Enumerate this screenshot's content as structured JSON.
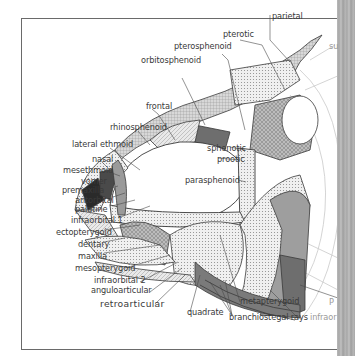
{
  "figure": {
    "labels": {
      "parietal": "parietal",
      "pterotic": "pterotic",
      "pterosphenoid": "pterosphenoid",
      "orbitosphenoid": "orbitosphenoid",
      "frontal": "frontal",
      "rhinosphenoid": "rhinosphenoid",
      "lateral_ethmoid": "lateral ethmoid",
      "nasal": "nasal",
      "mesethmoid": "mesethmoid",
      "vomer": "vomer",
      "premaxilla": "premaxilla",
      "antorbital": "antorbital",
      "palatine": "palatine",
      "infraorbital_1": "infraorbital 1",
      "ectopterygoid": "ectopterygoid",
      "dentary": "dentary",
      "maxilla": "maxilla",
      "mesopterygoid": "mesopterygoid",
      "infraorbital_2": "infraorbital 2",
      "anguloarticular": "anguloarticular",
      "retroarticular": "retroarticular",
      "sphenotic": "sphenotic",
      "prootic": "prootic",
      "parasphenoid": "parasphenoid",
      "quadrate": "quadrate",
      "branchiostegal_rays": "branchiostegal rays",
      "metapterygoid": "metapterygoid",
      "infraorbital_cut": "infraor",
      "right_cut_top": "su",
      "right_cut_p": "P"
    },
    "colors": {
      "line": "#3a3a3a",
      "light_stipple": "#e6e6e6",
      "mid_gray": "#bdbdbd",
      "dark_gray": "#6e6e6e",
      "darkest": "#2a2a2a",
      "gutter": "#b0b0b0"
    }
  }
}
